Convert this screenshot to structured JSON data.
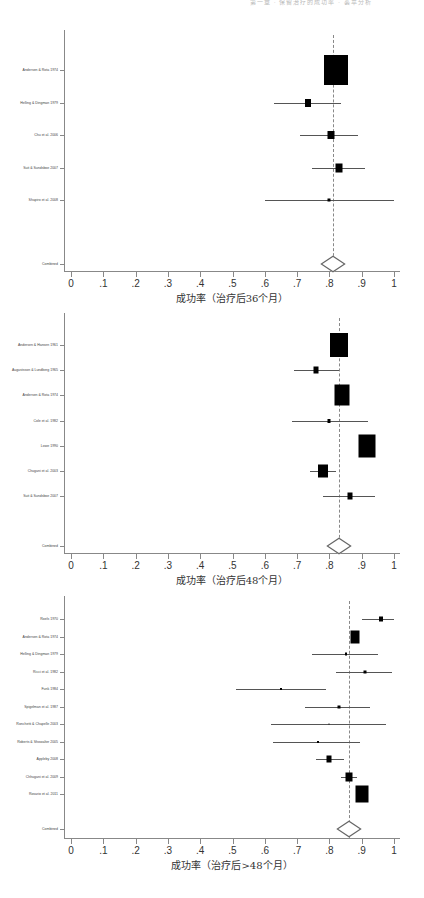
{
  "header_text": "第一章 · 保留治疗的成功率 · 荟萃分析",
  "chart_data": [
    {
      "type": "forest",
      "title": "",
      "xlabel": "成功率（治疗后36个月）",
      "xlim": [
        0,
        1
      ],
      "xticks": [
        "0",
        ".1",
        ".2",
        ".3",
        ".4",
        ".5",
        ".6",
        ".7",
        ".8",
        ".9",
        "1"
      ],
      "pooled_estimate": 0.81,
      "studies": [
        {
          "label": "Andersen & Rota 1974",
          "estimate": 0.82,
          "ci": [
            0.82,
            0.82
          ],
          "weight": "large",
          "box_w": 24,
          "box_h": 30
        },
        {
          "label": "Helling & Dingman 1979",
          "estimate": 0.735,
          "ci": [
            0.63,
            0.835
          ],
          "box_w": 6,
          "box_h": 8
        },
        {
          "label": "Chu et al. 2006",
          "estimate": 0.805,
          "ci": [
            0.71,
            0.89
          ],
          "box_w": 7,
          "box_h": 8
        },
        {
          "label": "Suit & Sundsboe 2007",
          "estimate": 0.83,
          "ci": [
            0.745,
            0.91
          ],
          "box_w": 7,
          "box_h": 9
        },
        {
          "label": "Shapiro et al. 2008",
          "estimate": 0.8,
          "ci": [
            0.6,
            1.0
          ],
          "box_w": 3,
          "box_h": 3
        }
      ],
      "combined_label": "Combined"
    },
    {
      "type": "forest",
      "title": "",
      "xlabel": "成功率（治疗后48个月）",
      "xlim": [
        0,
        1
      ],
      "xticks": [
        "0",
        ".1",
        ".2",
        ".3",
        ".4",
        ".5",
        ".6",
        ".7",
        ".8",
        ".9",
        "1"
      ],
      "pooled_estimate": 0.83,
      "studies": [
        {
          "label": "Andersen & Hansen 1961",
          "estimate": 0.83,
          "ci": [
            0.83,
            0.83
          ],
          "box_w": 18,
          "box_h": 24
        },
        {
          "label": "Augustsson & Lundberg 1965",
          "estimate": 0.76,
          "ci": [
            0.69,
            0.83
          ],
          "box_w": 5,
          "box_h": 7
        },
        {
          "label": "Andersen & Rota 1974",
          "estimate": 0.84,
          "ci": [
            0.84,
            0.84
          ],
          "box_w": 15,
          "box_h": 21
        },
        {
          "label": "Cole et al. 1982",
          "estimate": 0.8,
          "ci": [
            0.685,
            0.92
          ],
          "box_w": 3,
          "box_h": 4
        },
        {
          "label": "Lowe 1990",
          "estimate": 0.915,
          "ci": [
            0.915,
            0.915
          ],
          "box_w": 17,
          "box_h": 23
        },
        {
          "label": "Chugani et al. 2003",
          "estimate": 0.78,
          "ci": [
            0.74,
            0.82
          ],
          "box_w": 10,
          "box_h": 13
        },
        {
          "label": "Suit & Sundsboe 2007",
          "estimate": 0.865,
          "ci": [
            0.78,
            0.94
          ],
          "box_w": 5,
          "box_h": 7
        }
      ],
      "combined_label": "Combined"
    },
    {
      "type": "forest",
      "title": "",
      "xlabel": "成功率（治疗后>48个月）",
      "xlim": [
        0,
        1
      ],
      "xticks": [
        "0",
        ".1",
        ".2",
        ".3",
        ".4",
        ".5",
        ".6",
        ".7",
        ".8",
        ".9",
        "1"
      ],
      "pooled_estimate": 0.86,
      "studies": [
        {
          "label": "Roels 1970",
          "estimate": 0.96,
          "ci": [
            0.9,
            1.01
          ],
          "box_w": 4,
          "box_h": 5
        },
        {
          "label": "Andersen & Rota 1974",
          "estimate": 0.88,
          "ci": [
            0.87,
            0.89
          ],
          "box_w": 9,
          "box_h": 13
        },
        {
          "label": "Helling & Dingman 1979",
          "estimate": 0.85,
          "ci": [
            0.745,
            0.95
          ],
          "box_w": 2,
          "box_h": 3
        },
        {
          "label": "Ricci et al. 1982",
          "estimate": 0.91,
          "ci": [
            0.82,
            0.995
          ],
          "box_w": 3,
          "box_h": 3
        },
        {
          "label": "Funk 1984",
          "estimate": 0.65,
          "ci": [
            0.51,
            0.79
          ],
          "box_w": 2,
          "box_h": 2
        },
        {
          "label": "Spigelman et al. 1987",
          "estimate": 0.83,
          "ci": [
            0.725,
            0.925
          ],
          "box_w": 3,
          "box_h": 3
        },
        {
          "label": "Ronchetti & Chapelle 2003",
          "estimate": 0.8,
          "ci": [
            0.62,
            0.975
          ],
          "box_w": 1,
          "box_h": 1
        },
        {
          "label": "Roberts & Showalter 2005",
          "estimate": 0.765,
          "ci": [
            0.625,
            0.895
          ],
          "box_w": 2,
          "box_h": 2
        },
        {
          "label": "Appleby 2008",
          "estimate": 0.8,
          "ci": [
            0.76,
            0.845
          ],
          "box_w": 5,
          "box_h": 7
        },
        {
          "label": "Chhugani et al. 2009",
          "estimate": 0.86,
          "ci": [
            0.835,
            0.885
          ],
          "box_w": 7,
          "box_h": 9
        },
        {
          "label": "Rosario et al. 2011",
          "estimate": 0.9,
          "ci": [
            0.9,
            0.9
          ],
          "box_w": 13,
          "box_h": 17
        }
      ],
      "combined_label": "Combined"
    }
  ]
}
